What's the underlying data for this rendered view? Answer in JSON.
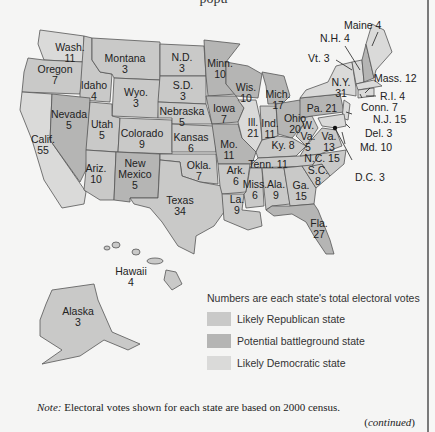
{
  "title_fragment": "popu",
  "legend": {
    "caption": "Numbers are each state's total electoral votes",
    "items": [
      {
        "label": "Likely Republican state",
        "color": "#c9c9c8"
      },
      {
        "label": "Potential battleground state",
        "color": "#b5b5b4"
      },
      {
        "label": "Likely Democratic state",
        "color": "#dadad9"
      }
    ]
  },
  "note": {
    "prefix": "Note:",
    "text": " Electoral votes shown for each state are based on 2000 census."
  },
  "continued": "continued",
  "states": [
    {
      "name": "Wash.",
      "votes": "11"
    },
    {
      "name": "Oregon",
      "votes": "7"
    },
    {
      "name": "Calif.",
      "votes": "55"
    },
    {
      "name": "Idaho",
      "votes": "4"
    },
    {
      "name": "Nevada",
      "votes": "5"
    },
    {
      "name": "Montana",
      "votes": "3"
    },
    {
      "name": "Wyo.",
      "votes": "3"
    },
    {
      "name": "Utah",
      "votes": "5"
    },
    {
      "name": "Colorado",
      "votes": "9"
    },
    {
      "name": "Ariz.",
      "votes": "10"
    },
    {
      "name": "New Mexico",
      "votes": "5"
    },
    {
      "name": "N.D.",
      "votes": "3"
    },
    {
      "name": "S.D.",
      "votes": "3"
    },
    {
      "name": "Nebraska",
      "votes": "5"
    },
    {
      "name": "Kansas",
      "votes": "6"
    },
    {
      "name": "Okla.",
      "votes": "7"
    },
    {
      "name": "Texas",
      "votes": "34"
    },
    {
      "name": "Minn.",
      "votes": "10"
    },
    {
      "name": "Iowa",
      "votes": "7"
    },
    {
      "name": "Mo.",
      "votes": "11"
    },
    {
      "name": "Ark.",
      "votes": "6"
    },
    {
      "name": "La.",
      "votes": "9"
    },
    {
      "name": "Wis.",
      "votes": "10"
    },
    {
      "name": "Ill.",
      "votes": "21"
    },
    {
      "name": "Mich.",
      "votes": "17"
    },
    {
      "name": "Ind.",
      "votes": "11"
    },
    {
      "name": "Ohio",
      "votes": "20"
    },
    {
      "name": "Ky.",
      "votes": "8"
    },
    {
      "name": "Tenn.",
      "votes": "11"
    },
    {
      "name": "Miss.",
      "votes": "6"
    },
    {
      "name": "Ala.",
      "votes": "9"
    },
    {
      "name": "Ga.",
      "votes": "15"
    },
    {
      "name": "Fla.",
      "votes": "27"
    },
    {
      "name": "S.C.",
      "votes": "8"
    },
    {
      "name": "N.C.",
      "votes": "15"
    },
    {
      "name": "Va.",
      "votes": "13"
    },
    {
      "name": "W. Va.",
      "votes": "5"
    },
    {
      "name": "Pa.",
      "votes": "21"
    },
    {
      "name": "N.Y.",
      "votes": "31"
    },
    {
      "name": "Hawaii",
      "votes": "4"
    },
    {
      "name": "Alaska",
      "votes": "3"
    }
  ],
  "callouts": {
    "maine": "Maine 4",
    "nh": "N.H. 4",
    "vt": "Vt. 3",
    "mass": "Mass. 12",
    "ri": "R.I. 4",
    "conn": "Conn. 7",
    "nj": "N.J. 15",
    "del": "Del. 3",
    "md": "Md. 10",
    "dc": "D.C. 3"
  }
}
